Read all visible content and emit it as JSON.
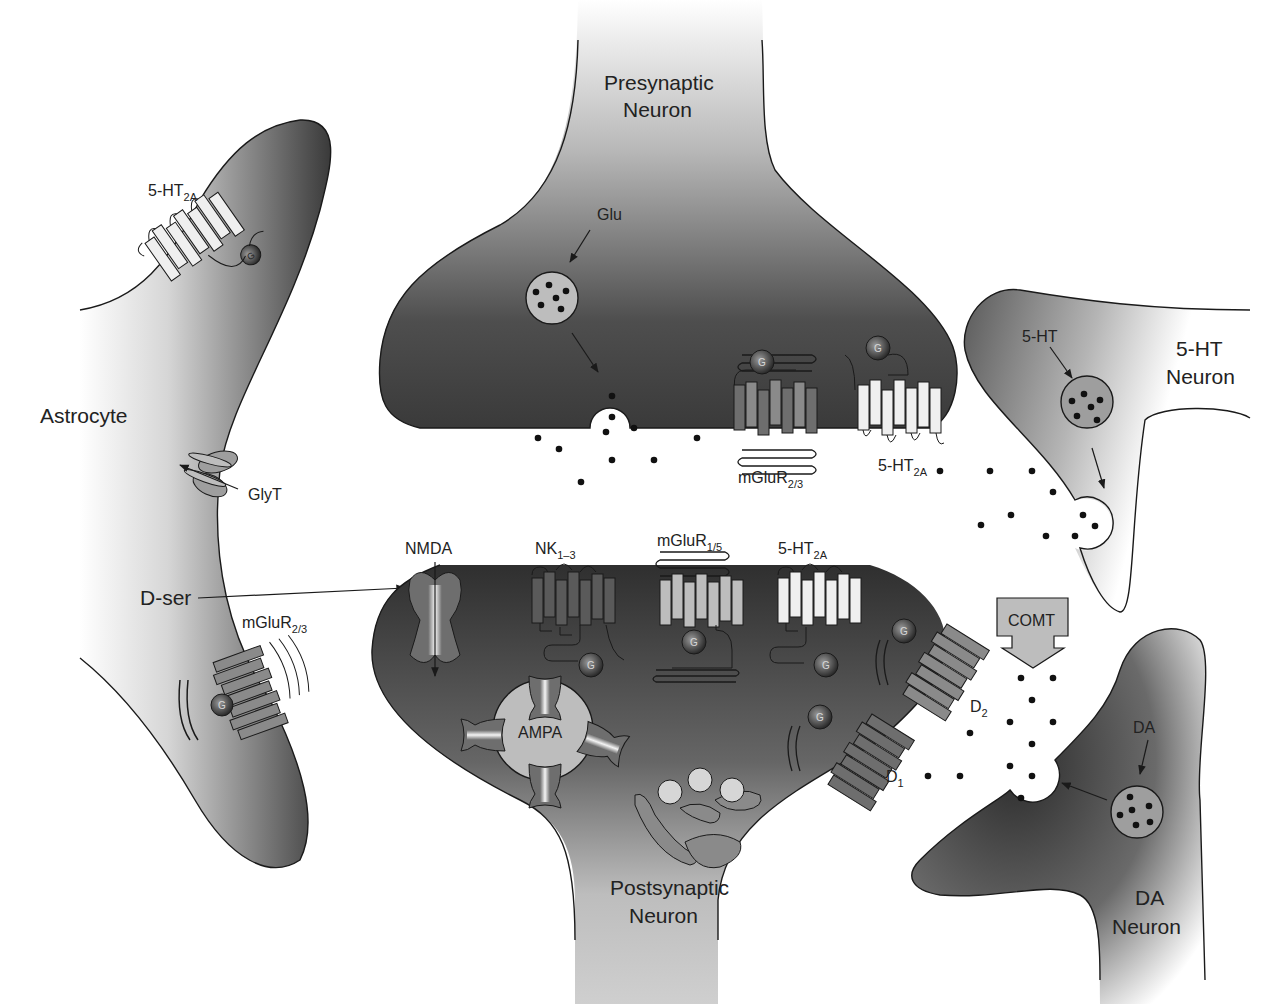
{
  "cells": {
    "presynaptic": {
      "line1": "Presynaptic",
      "line2": "Neuron"
    },
    "postsynaptic": {
      "line1": "Postsynaptic",
      "line2": "Neuron"
    },
    "astrocyte": {
      "label": "Astrocyte"
    },
    "ht_neuron": {
      "line1": "5-HT",
      "line2": "Neuron"
    },
    "da_neuron": {
      "line1": "DA",
      "line2": "Neuron"
    }
  },
  "neurotransmitters": {
    "glu": "Glu",
    "ht": "5-HT",
    "da": "DA",
    "dser": "D-ser"
  },
  "receptors": {
    "astro_ht2a": {
      "base": "5-HT",
      "sub": "2A"
    },
    "astro_glyt": {
      "base": "GlyT",
      "sub": ""
    },
    "astro_mglur23": {
      "base": "mGluR",
      "sub": "2/3"
    },
    "pre_mglur23": {
      "base": "mGluR",
      "sub": "2/3"
    },
    "pre_ht2a": {
      "base": "5-HT",
      "sub": "2A"
    },
    "nmda": {
      "base": "NMDA",
      "sub": ""
    },
    "nk": {
      "base": "NK",
      "sub": "1–3"
    },
    "mglur15": {
      "base": "mGluR",
      "sub": "1/5"
    },
    "post_ht2a": {
      "base": "5-HT",
      "sub": "2A"
    },
    "d2": {
      "base": "D",
      "sub": "2"
    },
    "d1": {
      "base": "D",
      "sub": "1"
    },
    "ampa": {
      "base": "AMPA",
      "sub": ""
    }
  },
  "enzymes": {
    "comt": "COMT"
  },
  "gprotein_label": "G",
  "colors": {
    "cell_dark": "#3a3a3a",
    "cell_light": "#d6d6d6",
    "receptor_dark": "#5a5a5a",
    "receptor_mid": "#8a8a8a",
    "receptor_light": "#bdbdbd",
    "receptor_white": "#efefef",
    "outline": "#1a1a1a"
  }
}
